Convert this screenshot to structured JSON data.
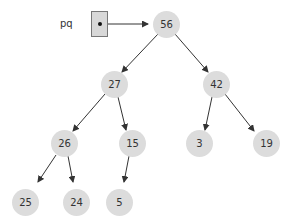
{
  "pointer": {
    "label": "pq",
    "target": "56"
  },
  "nodes": [
    {
      "id": "n0",
      "value": "56",
      "x": 166,
      "y": 24
    },
    {
      "id": "n1",
      "value": "27",
      "x": 114,
      "y": 84
    },
    {
      "id": "n2",
      "value": "42",
      "x": 216,
      "y": 84
    },
    {
      "id": "n3",
      "value": "26",
      "x": 64,
      "y": 143
    },
    {
      "id": "n4",
      "value": "15",
      "x": 132,
      "y": 143
    },
    {
      "id": "n5",
      "value": "3",
      "x": 199,
      "y": 143
    },
    {
      "id": "n6",
      "value": "19",
      "x": 266,
      "y": 143
    },
    {
      "id": "n7",
      "value": "25",
      "x": 25,
      "y": 202
    },
    {
      "id": "n8",
      "value": "24",
      "x": 76,
      "y": 202
    },
    {
      "id": "n9",
      "value": "5",
      "x": 119,
      "y": 202
    }
  ],
  "edges": [
    [
      "56",
      "27"
    ],
    [
      "56",
      "42"
    ],
    [
      "27",
      "26"
    ],
    [
      "27",
      "15"
    ],
    [
      "42",
      "3"
    ],
    [
      "42",
      "19"
    ],
    [
      "26",
      "25"
    ],
    [
      "26",
      "24"
    ],
    [
      "15",
      "5"
    ]
  ],
  "colors": {
    "node_fill": "#dcdcdc",
    "edge": "#333333",
    "box_fill": "#d8d8d8"
  }
}
